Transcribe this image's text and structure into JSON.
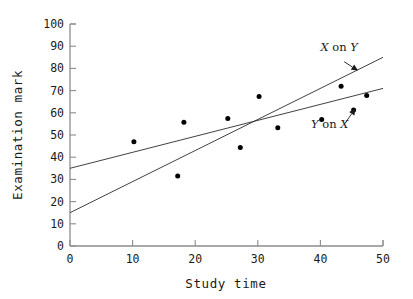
{
  "chart_data": {
    "type": "scatter",
    "title": "",
    "xlabel": "Study time",
    "ylabel": "Examination mark",
    "xlim": [
      0,
      50
    ],
    "ylim": [
      0,
      100
    ],
    "xticks": [
      0,
      10,
      20,
      30,
      40,
      50
    ],
    "yticks": [
      0,
      10,
      20,
      30,
      40,
      50,
      60,
      70,
      80,
      90,
      100
    ],
    "xtick_labels": [
      "0",
      "10",
      "20",
      "30",
      "40",
      "50"
    ],
    "ytick_labels": [
      "0",
      "10",
      "20",
      "30",
      "40",
      "50",
      "60",
      "70",
      "80",
      "90",
      "100"
    ],
    "grid": false,
    "legend": "none",
    "points": [
      {
        "x": 10.2,
        "y": 47.0
      },
      {
        "x": 17.2,
        "y": 31.5
      },
      {
        "x": 18.2,
        "y": 55.7
      },
      {
        "x": 25.2,
        "y": 57.5
      },
      {
        "x": 27.2,
        "y": 44.4
      },
      {
        "x": 30.2,
        "y": 67.3
      },
      {
        "x": 33.2,
        "y": 53.3
      },
      {
        "x": 40.2,
        "y": 57.0
      },
      {
        "x": 43.3,
        "y": 72.0
      },
      {
        "x": 45.3,
        "y": 61.2
      },
      {
        "x": 47.4,
        "y": 67.8
      }
    ],
    "lines": [
      {
        "name": "Y on X",
        "label": "Y on X",
        "label_italic_parts": [
          "Y",
          "on",
          "X"
        ],
        "x1": 0,
        "y1": 35.0,
        "x2": 50,
        "y2": 71.0,
        "slope": 0.72,
        "intercept": 35.0
      },
      {
        "name": "X on Y",
        "label": "X on Y",
        "label_italic_parts": [
          "X",
          "on",
          "Y"
        ],
        "x1": 0,
        "y1": 15.0,
        "x2": 50,
        "y2": 85.0,
        "slope": 1.4,
        "intercept": 15.0
      }
    ],
    "annotations": [
      {
        "name": "x-on-y-annotation",
        "text": "X on Y",
        "italic_first": "X",
        "roman_mid": "on",
        "italic_last": "Y",
        "label_x": 43.0,
        "label_y": 88.0,
        "arrow_from_x": 43.8,
        "arrow_from_y": 83.0,
        "arrow_to_x": 46.0,
        "arrow_to_y": 79.0
      },
      {
        "name": "y-on-x-annotation",
        "text": "Y on X",
        "italic_first": "Y",
        "roman_mid": "on",
        "italic_last": "X",
        "label_x": 41.5,
        "label_y": 53.0,
        "arrow_from_x": 44.0,
        "arrow_from_y": 55.5,
        "arrow_to_x": 45.6,
        "arrow_to_y": 62.0
      }
    ],
    "colors": {
      "axis": "#8c8c8c",
      "line": "#2b2b2b",
      "point": "#000000",
      "text": "#1a1a1a",
      "background": "#ffffff"
    }
  }
}
